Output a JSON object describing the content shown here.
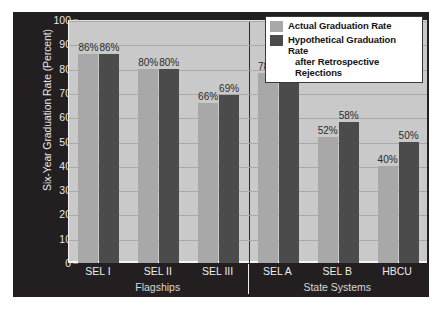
{
  "chart_data": {
    "type": "bar",
    "title": "",
    "xlabel": "",
    "ylabel": "Six-Year Graduation Rate (Percent)",
    "ylim": [
      0,
      100
    ],
    "ytick_step": 10,
    "yticks": [
      100,
      90,
      80,
      70,
      60,
      50,
      40,
      30,
      20,
      10,
      0
    ],
    "grid": true,
    "legend_position": "top-right",
    "categories": [
      "SEL I",
      "SEL II",
      "SEL III",
      "SEL A",
      "SEL B",
      "HBCU"
    ],
    "groups": [
      {
        "name": "Flagships",
        "categories": [
          "SEL I",
          "SEL II",
          "SEL III"
        ]
      },
      {
        "name": "State Systems",
        "categories": [
          "SEL A",
          "SEL B",
          "HBCU"
        ]
      }
    ],
    "series": [
      {
        "name": "Actual Graduation Rate",
        "color": "#a8a8a8",
        "values": [
          86,
          80,
          66,
          78,
          52,
          40
        ],
        "labels": [
          "86%",
          "80%",
          "66%",
          "78%",
          "52%",
          "40%"
        ]
      },
      {
        "name": "Hypothetical Graduation Rate after Retrospective Rejections",
        "color": "#4b4b4b",
        "values": [
          86,
          80,
          69,
          79,
          58,
          50
        ],
        "labels": [
          "86%",
          "80%",
          "69%",
          "79%",
          "58%",
          "50%"
        ]
      }
    ]
  },
  "legend": {
    "entries": [
      {
        "label": "Actual Graduation Rate",
        "line2": ""
      },
      {
        "label": "Hypothetical Graduation Rate",
        "line2": "after Retrospective Rejections"
      }
    ]
  },
  "colors": {
    "figure_background": "#231f20",
    "plot_background": "#c9c9c9",
    "actual_bar": "#a8a8a8",
    "hypothetical_bar": "#4b4b4b",
    "gridline": "#a9a9a9",
    "tick_text": "#e8e8e8"
  }
}
